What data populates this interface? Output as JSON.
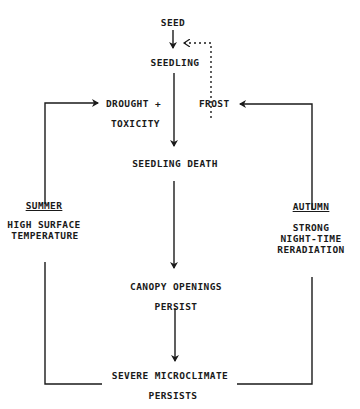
{
  "nodes": {
    "seed": "SEED",
    "seedling": "SEEDLING",
    "drought_line1": "DROUGHT +",
    "drought_line2": "TOXICITY",
    "frost": "FROST",
    "seedling_death": "SEEDLING  DEATH",
    "canopy_line1": "CANOPY OPENINGS",
    "canopy_line2": "PERSIST",
    "severe_line1": "SEVERE MICROCLIMATE",
    "severe_line2": "PERSISTS"
  },
  "seasons": {
    "summer": {
      "title": "SUMMER",
      "line1": "HIGH SURFACE",
      "line2": "TEMPERATURE"
    },
    "autumn": {
      "title": "AUTUMN",
      "line1": "STRONG",
      "line2": "NIGHT-TIME",
      "line3": "RERADIATION"
    }
  },
  "colors": {
    "ink": "#1a1a1a",
    "background": "#ffffff"
  }
}
